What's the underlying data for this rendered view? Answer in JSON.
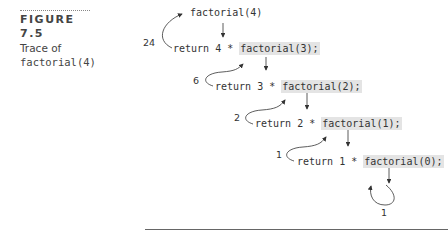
{
  "caption": {
    "figure_label": "FIGURE 7.5",
    "title_line1": "Trace of",
    "title_line2": "factorial(4)"
  },
  "trace": {
    "initial_call": "factorial(4)",
    "steps": [
      {
        "prefix": "return 4 * ",
        "call": "factorial(3);",
        "return_value": "24"
      },
      {
        "prefix": "return 3 * ",
        "call": "factorial(2);",
        "return_value": "6"
      },
      {
        "prefix": "return 2 * ",
        "call": "factorial(1);",
        "return_value": "2"
      },
      {
        "prefix": "return 1 * ",
        "call": "factorial(0);",
        "return_value": "1"
      }
    ],
    "base_return_value": "1"
  },
  "colors": {
    "highlight": "#e4e4e4",
    "text": "#333333",
    "rule": "#666666"
  }
}
